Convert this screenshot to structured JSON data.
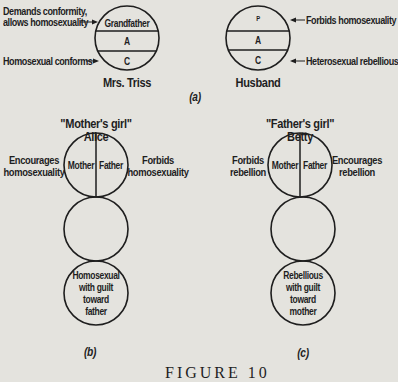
{
  "panel_a": {
    "label": "(a)",
    "mrs_triss": {
      "name": "Mrs. Triss",
      "sections": [
        "Grandfather",
        "A",
        "C"
      ],
      "annotations": {
        "top_line1": "Demands conformity,",
        "top_line2": "allows homosexuality",
        "bottom": "Homosexual conforms"
      }
    },
    "husband": {
      "name": "Husband",
      "sections": [
        "P",
        "A",
        "C"
      ],
      "annotations": {
        "top": "Forbids homosexuality",
        "bottom": "Heterosexual rebellious"
      }
    }
  },
  "panel_b": {
    "label": "(b)",
    "title": "\"Mother's girl\"",
    "name": "Alice",
    "top_circle": {
      "left": "Mother",
      "right": "Father"
    },
    "left_note": [
      "Encourages",
      "homosexuality"
    ],
    "right_note": [
      "Forbids",
      "homosexuality"
    ],
    "bottom_circle": [
      "Homosexual",
      "with guilt",
      "toward",
      "father"
    ]
  },
  "panel_c": {
    "label": "(c)",
    "title": "\"Father's girl\"",
    "name": "Betty",
    "top_circle": {
      "left": "Mother",
      "right": "Father"
    },
    "left_note": [
      "Forbids",
      "rebellion"
    ],
    "right_note": [
      "Encourages",
      "rebellion"
    ],
    "bottom_circle": [
      "Rebellious",
      "with guilt",
      "toward",
      "mother"
    ]
  },
  "caption": "FIGURE 10",
  "colors": {
    "ink": "#1e1e1e",
    "paper": "#e4e3de"
  }
}
